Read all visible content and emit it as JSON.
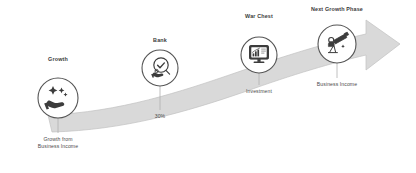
{
  "diagram": {
    "background_color": "#ffffff",
    "arrow": {
      "name": "upward-growth-arrow",
      "fill_color": "#d9d9d9",
      "stroke_color": "#bfbfbf",
      "direction": "up-right"
    },
    "stem_color": "#b5b5b5",
    "circle_fill": "#ffffff",
    "circle_stroke": "#5a5a5a",
    "icon_color": "#3c3c3c"
  },
  "nodes": [
    {
      "id": "growth",
      "title": "Growth",
      "icon": "hand-with-sparkles-icon",
      "sub_line1": "Growth from",
      "sub_line2": "Business Income",
      "sub_text": "Growth from\nBusiness Income",
      "cx": 58,
      "cy": 98,
      "r": 20,
      "title_x": 47,
      "title_y": 60,
      "stem_to_y": 133,
      "sub_x": 58,
      "sub_y": 137
    },
    {
      "id": "bank",
      "title": "Bank",
      "icon": "check-badge-hand-icon",
      "sub_line1": "30%",
      "sub_line2": "",
      "sub_text": "30%",
      "cx": 160,
      "cy": 68,
      "r": 18,
      "title_x": 155,
      "title_y": 41,
      "stem_to_y": 110,
      "sub_x": 160,
      "sub_y": 114
    },
    {
      "id": "war-chest",
      "title": "War Chest",
      "icon": "monitor-bar-chart-icon",
      "sub_line1": "Investment",
      "sub_line2": "",
      "sub_text": "Investment",
      "cx": 259,
      "cy": 55,
      "r": 18,
      "title_x": 243,
      "title_y": 16,
      "stem_to_y": 85,
      "sub_x": 259,
      "sub_y": 89
    },
    {
      "id": "next-growth-phase",
      "title": "Next Growth Phase",
      "icon": "person-telescope-icon",
      "sub_line1": "Business Income",
      "sub_line2": "",
      "sub_text": "Business Income",
      "cx": 337,
      "cy": 44,
      "r": 19,
      "title_x": 309,
      "title_y": 8,
      "stem_to_y": 78,
      "sub_x": 337,
      "sub_y": 82
    }
  ]
}
